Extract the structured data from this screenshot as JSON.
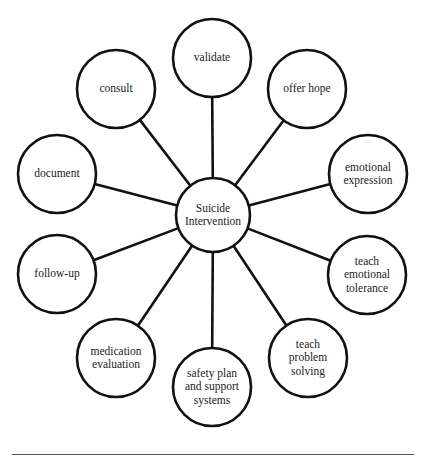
{
  "diagram": {
    "type": "hub-and-spoke",
    "stroke_color": "#111111",
    "background": "#ffffff",
    "center": {
      "id": "suicide-intervention",
      "label": "Suicide\nIntervention",
      "cx": 213,
      "cy": 215,
      "r": 37
    },
    "nodes": [
      {
        "id": "validate",
        "label": "validate",
        "cx": 212,
        "cy": 58,
        "r": 39
      },
      {
        "id": "offer-hope",
        "label": "offer hope",
        "cx": 307,
        "cy": 89,
        "r": 39
      },
      {
        "id": "emotional-expression",
        "label": "emotional\nexpression",
        "cx": 368,
        "cy": 174,
        "r": 39
      },
      {
        "id": "teach-emotional-tolerance",
        "label": "teach\nemotional\ntolerance",
        "cx": 367,
        "cy": 275,
        "r": 39
      },
      {
        "id": "teach-problem-solving",
        "label": "teach\nproblem\nsolving",
        "cx": 308,
        "cy": 358,
        "r": 39
      },
      {
        "id": "safety-plan",
        "label": "safety plan\nand support\nsystems",
        "cx": 212,
        "cy": 387,
        "r": 39
      },
      {
        "id": "medication-evaluation",
        "label": "medication\nevaluation",
        "cx": 116,
        "cy": 358,
        "r": 39
      },
      {
        "id": "follow-up",
        "label": "follow-up",
        "cx": 57,
        "cy": 274,
        "r": 39
      },
      {
        "id": "document",
        "label": "document",
        "cx": 57,
        "cy": 174,
        "r": 39
      },
      {
        "id": "consult",
        "label": "consult",
        "cx": 116,
        "cy": 89,
        "r": 39
      }
    ]
  },
  "caption_rule": true
}
